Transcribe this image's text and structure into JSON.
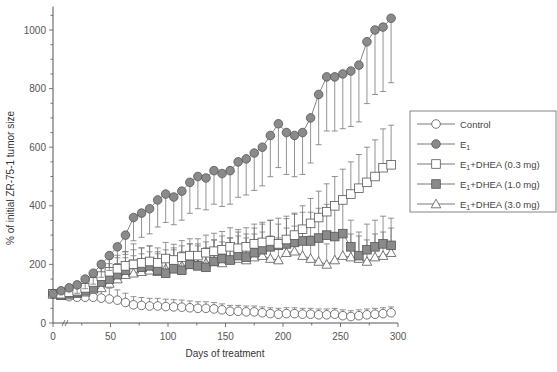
{
  "chart_data": {
    "type": "line",
    "title": "",
    "xlabel": "Days of treatment",
    "ylabel": "% of initial ZR-75-1 tumor size",
    "xlim": [
      0,
      300
    ],
    "ylim": [
      0,
      1100
    ],
    "xticks": [
      0,
      50,
      100,
      150,
      200,
      250,
      300
    ],
    "yticks": [
      0,
      200,
      400,
      600,
      800,
      1000
    ],
    "grid": false,
    "legend_position": "right",
    "error_bars": "upper SEM whiskers",
    "x": [
      0,
      7,
      14,
      21,
      28,
      35,
      42,
      49,
      56,
      63,
      70,
      77,
      84,
      91,
      98,
      105,
      112,
      119,
      126,
      133,
      140,
      147,
      154,
      161,
      168,
      175,
      182,
      189,
      196,
      203,
      210,
      217,
      224,
      231,
      238,
      245,
      252,
      259,
      266,
      273,
      280,
      287,
      294
    ],
    "series": [
      {
        "name": "Control",
        "marker": "open-circle",
        "values": [
          100,
          95,
          90,
          88,
          88,
          88,
          85,
          82,
          78,
          70,
          62,
          60,
          58,
          58,
          56,
          55,
          54,
          52,
          50,
          50,
          48,
          45,
          40,
          40,
          38,
          38,
          35,
          32,
          30,
          32,
          32,
          30,
          30,
          28,
          28,
          30,
          25,
          22,
          25,
          28,
          30,
          32,
          35
        ]
      },
      {
        "name": "E1",
        "marker": "filled-circle",
        "values": [
          100,
          110,
          120,
          130,
          150,
          170,
          200,
          230,
          260,
          300,
          360,
          375,
          390,
          420,
          440,
          430,
          450,
          480,
          500,
          495,
          520,
          510,
          520,
          550,
          560,
          580,
          600,
          640,
          680,
          650,
          640,
          650,
          700,
          780,
          840,
          840,
          850,
          860,
          880,
          960,
          1000,
          1010,
          1040
        ]
      },
      {
        "name": "E1+DHEA (0.3 mg)",
        "marker": "open-square",
        "values": [
          100,
          100,
          105,
          110,
          120,
          140,
          160,
          175,
          185,
          195,
          200,
          205,
          210,
          205,
          220,
          215,
          225,
          230,
          230,
          240,
          245,
          250,
          260,
          255,
          260,
          270,
          275,
          280,
          270,
          285,
          300,
          320,
          340,
          360,
          380,
          400,
          420,
          440,
          460,
          480,
          500,
          530,
          540
        ]
      },
      {
        "name": "E1+DHEA (1.0 mg)",
        "marker": "filled-square",
        "values": [
          100,
          95,
          100,
          105,
          110,
          120,
          140,
          150,
          165,
          180,
          200,
          190,
          195,
          180,
          170,
          185,
          180,
          200,
          195,
          190,
          210,
          220,
          215,
          230,
          225,
          240,
          250,
          260,
          265,
          270,
          275,
          280,
          280,
          290,
          300,
          295,
          305,
          260,
          230,
          250,
          260,
          270,
          265
        ]
      },
      {
        "name": "E1+DHEA (3.0 mg)",
        "marker": "open-triangle",
        "values": [
          100,
          95,
          95,
          100,
          105,
          115,
          120,
          135,
          150,
          165,
          170,
          175,
          180,
          175,
          185,
          190,
          195,
          200,
          200,
          205,
          210,
          205,
          215,
          220,
          215,
          225,
          230,
          220,
          215,
          240,
          245,
          230,
          220,
          210,
          200,
          215,
          230,
          225,
          220,
          210,
          225,
          230,
          240
        ]
      }
    ]
  },
  "legend": {
    "items": [
      {
        "label": "Control"
      },
      {
        "label": "E",
        "sub": "1",
        "suffix": ""
      },
      {
        "label": "E",
        "sub": "1",
        "suffix": "+DHEA (0.3 mg)"
      },
      {
        "label": "E",
        "sub": "1",
        "suffix": "+DHEA (1.0 mg)"
      },
      {
        "label": "E",
        "sub": "1",
        "suffix": "+DHEA (3.0 mg)"
      }
    ]
  },
  "colors": {
    "axis": "#555555",
    "filled": "#8a8a8a",
    "open": "#ffffff",
    "line": "#666666",
    "error": "#777777"
  }
}
